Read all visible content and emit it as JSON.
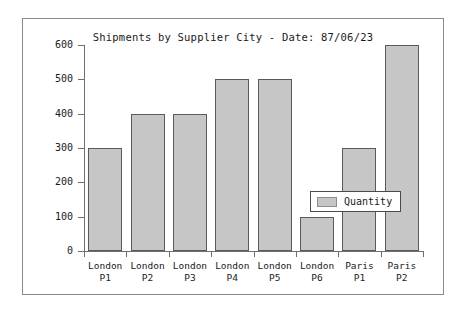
{
  "chart_data": {
    "type": "bar",
    "title": "Shipments by Supplier City - Date: 87/06/23",
    "xlabel": "",
    "ylabel": "",
    "categories": [
      "London P1",
      "London P2",
      "London P3",
      "London P4",
      "London P5",
      "London P6",
      "Paris P1",
      "Paris P2"
    ],
    "category_lines": [
      [
        "London",
        "P1"
      ],
      [
        "London",
        "P2"
      ],
      [
        "London",
        "P3"
      ],
      [
        "London",
        "P4"
      ],
      [
        "London",
        "P5"
      ],
      [
        "London",
        "P6"
      ],
      [
        "Paris",
        "P1"
      ],
      [
        "Paris",
        "P2"
      ]
    ],
    "series": [
      {
        "name": "Quantity",
        "values": [
          300,
          400,
          400,
          500,
          500,
          100,
          300,
          600
        ]
      }
    ],
    "ylim": [
      0,
      600
    ],
    "yticks": [
      0,
      100,
      200,
      300,
      400,
      500,
      600
    ],
    "ytick_labels": [
      "0",
      "100",
      "200",
      "300",
      "400",
      "500",
      "600"
    ],
    "grid": false,
    "legend": {
      "position": "center-right",
      "entries": [
        {
          "label": "Quantity",
          "color": "#c6c6c6"
        }
      ]
    },
    "colors": {
      "bar_fill": "#c6c6c6",
      "bar_edge": "#5a5a5a",
      "axis": "#6f6f6f",
      "text": "#1a1a1a",
      "frame": "#8a8a8a",
      "background": "#ffffff"
    }
  }
}
